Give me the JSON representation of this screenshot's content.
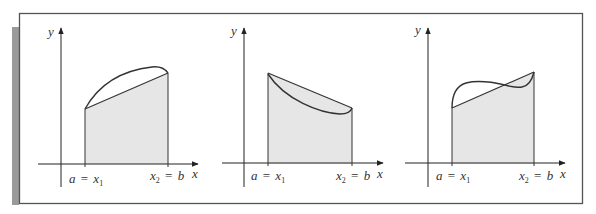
{
  "figure": {
    "colors": {
      "frame": "#555555",
      "side_bar": "#9a9a9a",
      "fill": "#e6e6e6",
      "stroke": "#333333",
      "background": "#ffffff"
    },
    "panels": [
      {
        "id": "concave-down",
        "y_label": "y",
        "x_label": "x",
        "a_label": "a",
        "x1_label": "x",
        "x1_sub": "1",
        "x2_label": "x",
        "x2_sub": "2",
        "b_label": "b",
        "eq": "=",
        "curve_type": "concave down (curve above chord)"
      },
      {
        "id": "concave-up",
        "y_label": "y",
        "x_label": "x",
        "a_label": "a",
        "x1_label": "x",
        "x1_sub": "1",
        "x2_label": "x",
        "x2_sub": "2",
        "b_label": "b",
        "eq": "=",
        "curve_type": "concave up decreasing (curve below chord)"
      },
      {
        "id": "inflection",
        "y_label": "y",
        "x_label": "x",
        "a_label": "a",
        "x1_label": "x",
        "x1_sub": "1",
        "x2_label": "x",
        "x2_sub": "2",
        "b_label": "b",
        "eq": "=",
        "curve_type": "wavy curve crossing chord"
      }
    ]
  }
}
